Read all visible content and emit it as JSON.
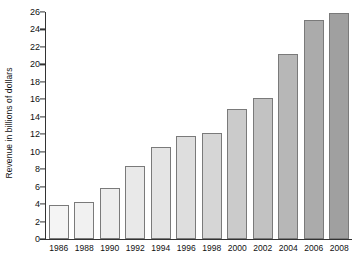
{
  "chart_data": {
    "type": "bar",
    "title": "",
    "xlabel": "",
    "ylabel": "Revenue in billions of dollars",
    "categories": [
      "1986",
      "1988",
      "1990",
      "1992",
      "1994",
      "1996",
      "1998",
      "2000",
      "2002",
      "2004",
      "2006",
      "2008"
    ],
    "values": [
      3.9,
      4.2,
      5.8,
      8.4,
      10.5,
      11.8,
      12.2,
      14.9,
      16.2,
      21.2,
      25.1,
      25.9
    ],
    "ylim": [
      0,
      26
    ],
    "ytick_labels": [
      "0",
      "2",
      "4",
      "6",
      "8",
      "10",
      "12",
      "14",
      "16",
      "18",
      "20",
      "22",
      "24",
      "26"
    ],
    "ytick_values": [
      0,
      2,
      4,
      6,
      8,
      10,
      12,
      14,
      16,
      18,
      20,
      22,
      24,
      26
    ],
    "grid": false,
    "legend": "none",
    "bar_colors": [
      "#f4f4f4",
      "#f1f1f1",
      "#ededed",
      "#e9e9e9",
      "#e4e4e4",
      "#dedede",
      "#d6d6d6",
      "#cbcbcb",
      "#c2c2c2",
      "#b7b7b7",
      "#ababab",
      "#a0a0a0"
    ],
    "bar_edge_color": "#7a7a7a",
    "axis_color": "#333333",
    "background_color": "#ffffff"
  }
}
